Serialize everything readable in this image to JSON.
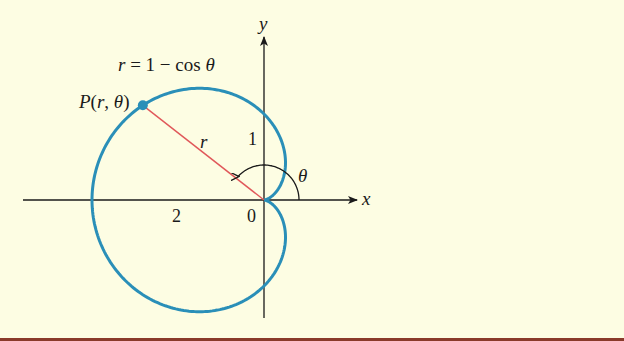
{
  "figure": {
    "background": "#fdfde3",
    "curve_color": "#2a8fb8",
    "radius_color": "#e0585a",
    "axis_color": "#1a1a1a",
    "rule_color": "#8a3a2a",
    "equation_label": "r = 1 − cos θ",
    "equation_parts": {
      "r": "r",
      "rest": " = 1 − cos ",
      "theta": "θ"
    },
    "point_label": "P(r, θ)",
    "point_label_parts": {
      "P": "P",
      "open": "(",
      "r": "r",
      "comma": ", ",
      "theta": "θ",
      "close": ")"
    },
    "radius_label": "r",
    "angle_label": "θ",
    "x_axis_label": "x",
    "y_axis_label": "y",
    "tick_labels": {
      "origin": "0",
      "x_neg2": "2",
      "y_1": "1"
    }
  },
  "chart_data": {
    "type": "polar-curve",
    "title": "r = 1 − cos θ",
    "curve": "cardioid",
    "equation": "r = 1 - cos(theta)",
    "marked_point": {
      "label": "P(r, θ)",
      "theta_deg": 142,
      "r": 1.79
    },
    "axes": {
      "x": "x",
      "y": "y"
    },
    "tick_labels": [
      {
        "axis": "x",
        "value": -2,
        "label": "2"
      },
      {
        "axis": "origin",
        "value": 0,
        "label": "0"
      },
      {
        "axis": "y",
        "value": 1,
        "label": "1"
      }
    ],
    "xlim": [
      -2.8,
      1.1
    ],
    "ylim": [
      -1.4,
      1.9
    ],
    "grid": false
  }
}
